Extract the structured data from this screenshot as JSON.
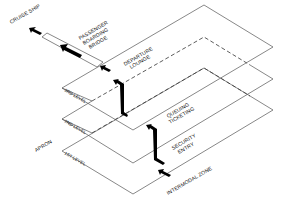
{
  "diagram": {
    "type": "isometric-flow",
    "colors": {
      "line": "#555555",
      "arrow": "#000000",
      "background": "#ffffff"
    },
    "levels": [
      {
        "id": "level3",
        "label": "3RD LEVEL",
        "zone_labels": [
          "DEPARTURE",
          "LOUNGE"
        ],
        "style": "solid"
      },
      {
        "id": "level2",
        "label": "2ND LEVEL",
        "zone_labels": [
          "QUEUING",
          "TICKETING"
        ],
        "style": "solid-dashed"
      },
      {
        "id": "level1",
        "label": "1ST LEVEL",
        "zone_labels": [
          "SECURITY",
          "ENTRY"
        ],
        "style": "solid-dashed"
      }
    ],
    "bridge": {
      "lines": [
        "PASSENGER",
        "BOARDING",
        "BRIDGE"
      ]
    },
    "external_labels": {
      "cruise_ship": "CRUISE SHIP",
      "apron": "APRON",
      "intermodal": "INTERMODAL ZONE"
    },
    "flow": [
      "INTERMODAL ZONE",
      "SECURITY ENTRY",
      "QUEUING TICKETING",
      "DEPARTURE LOUNGE",
      "PASSENGER BOARDING BRIDGE",
      "CRUISE SHIP"
    ]
  }
}
